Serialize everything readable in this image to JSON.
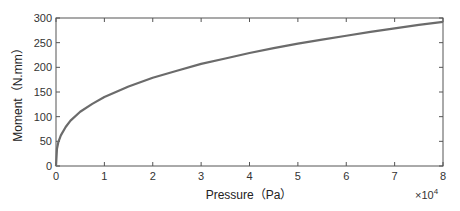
{
  "chart_data": {
    "type": "line",
    "title": "",
    "xlabel": "Pressure（Pa）",
    "ylabel": "Moment（N.mm）",
    "x_multiplier": "×10",
    "x_multiplier_exp": "4",
    "xlim": [
      0,
      8
    ],
    "ylim": [
      0,
      300
    ],
    "xticks": [
      "0",
      "1",
      "2",
      "3",
      "4",
      "5",
      "6",
      "7",
      "8"
    ],
    "yticks": [
      "0",
      "50",
      "100",
      "150",
      "200",
      "250",
      "300"
    ],
    "grid": false,
    "legend": null,
    "series": [
      {
        "name": "Moment",
        "color": "#6b6b6b",
        "x": [
          0,
          0.02,
          0.05,
          0.1,
          0.2,
          0.3,
          0.5,
          0.75,
          1,
          1.5,
          2,
          2.5,
          3,
          3.5,
          4,
          4.5,
          5,
          5.5,
          6,
          6.5,
          7,
          7.5,
          8
        ],
        "y": [
          0,
          35,
          49,
          62,
          79,
          92,
          110,
          126,
          140,
          161,
          179,
          193,
          207,
          218,
          229,
          239,
          248,
          256,
          264,
          272,
          279,
          286,
          292
        ]
      }
    ]
  }
}
